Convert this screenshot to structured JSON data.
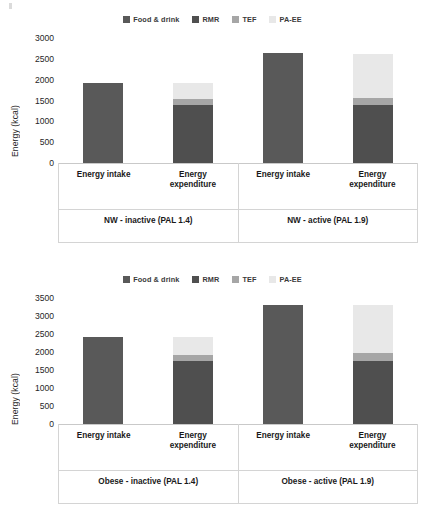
{
  "legend": {
    "items": [
      {
        "label": "Food & drink",
        "color": "#595959",
        "name": "legend-food-drink"
      },
      {
        "label": "RMR",
        "color": "#4f4f4f",
        "name": "legend-rmr"
      },
      {
        "label": "TEF",
        "color": "#a6a6a6",
        "name": "legend-tef"
      },
      {
        "label": "PA-EE",
        "color": "#e8e8e8",
        "name": "legend-pa-ee"
      }
    ]
  },
  "charts": [
    {
      "id": "nw",
      "ylabel": "Energy (kcal)",
      "yticks": [
        "3000",
        "2500",
        "2000",
        "1500",
        "1000",
        "500",
        "0"
      ],
      "groups": [
        {
          "label": "NW - inactive (PAL 1.4)",
          "bars": [
            {
              "label": "Energy intake",
              "segments": [
                {
                  "series": "Food & drink",
                  "value": 1920
                }
              ]
            },
            {
              "label": "Energy\nexpenditure",
              "segments": [
                {
                  "series": "RMR",
                  "value": 1390
                },
                {
                  "series": "TEF",
                  "value": 140
                },
                {
                  "series": "PA-EE",
                  "value": 390
                }
              ]
            }
          ]
        },
        {
          "label": "NW - active (PAL 1.9)",
          "bars": [
            {
              "label": "Energy intake",
              "segments": [
                {
                  "series": "Food & drink",
                  "value": 2630
                }
              ]
            },
            {
              "label": "Energy\nexpenditure",
              "segments": [
                {
                  "series": "RMR",
                  "value": 1390
                },
                {
                  "series": "TEF",
                  "value": 160
                },
                {
                  "series": "PA-EE",
                  "value": 1070
                }
              ]
            }
          ]
        }
      ]
    },
    {
      "id": "obese",
      "ylabel": "Energy (kcal)",
      "yticks": [
        "3500",
        "3000",
        "2500",
        "2000",
        "1500",
        "1000",
        "500",
        "0"
      ],
      "groups": [
        {
          "label": "Obese - inactive (PAL 1.4)",
          "bars": [
            {
              "label": "Energy intake",
              "segments": [
                {
                  "series": "Food & drink",
                  "value": 2420
                }
              ]
            },
            {
              "label": "Energy\nexpenditure",
              "segments": [
                {
                  "series": "RMR",
                  "value": 1750
                },
                {
                  "series": "TEF",
                  "value": 170
                },
                {
                  "series": "PA-EE",
                  "value": 500
                }
              ]
            }
          ]
        },
        {
          "label": "Obese - active (PAL 1.9)",
          "bars": [
            {
              "label": "Energy intake",
              "segments": [
                {
                  "series": "Food & drink",
                  "value": 3300
                }
              ]
            },
            {
              "label": "Energy\nexpenditure",
              "segments": [
                {
                  "series": "RMR",
                  "value": 1760
                },
                {
                  "series": "TEF",
                  "value": 200
                },
                {
                  "series": "PA-EE",
                  "value": 1340
                }
              ]
            }
          ]
        }
      ]
    }
  ],
  "chart_data": [
    {
      "type": "bar",
      "stacked": true,
      "title": "",
      "xlabel": "",
      "ylabel": "Energy (kcal)",
      "ylim": [
        0,
        3000
      ],
      "ytick_step": 500,
      "grid": false,
      "legend_position": "top-center",
      "group_labels": [
        "NW - inactive (PAL 1.4)",
        "NW - active (PAL 1.9)"
      ],
      "categories": [
        "NW - inactive (PAL 1.4) / Energy intake",
        "NW - inactive (PAL 1.4) / Energy expenditure",
        "NW - active (PAL 1.9) / Energy intake",
        "NW - active (PAL 1.9) / Energy expenditure"
      ],
      "series": [
        {
          "name": "Food & drink",
          "color": "#595959",
          "values": [
            1920,
            0,
            2630,
            0
          ]
        },
        {
          "name": "RMR",
          "color": "#4f4f4f",
          "values": [
            0,
            1390,
            0,
            1390
          ]
        },
        {
          "name": "TEF",
          "color": "#a6a6a6",
          "values": [
            0,
            140,
            0,
            160
          ]
        },
        {
          "name": "PA-EE",
          "color": "#e8e8e8",
          "values": [
            0,
            390,
            0,
            1070
          ]
        }
      ],
      "totals": [
        1920,
        1920,
        2630,
        2620
      ]
    },
    {
      "type": "bar",
      "stacked": true,
      "title": "",
      "xlabel": "",
      "ylabel": "Energy (kcal)",
      "ylim": [
        0,
        3500
      ],
      "ytick_step": 500,
      "grid": false,
      "legend_position": "top-center",
      "group_labels": [
        "Obese - inactive (PAL 1.4)",
        "Obese - active (PAL 1.9)"
      ],
      "categories": [
        "Obese - inactive (PAL 1.4) / Energy intake",
        "Obese - inactive (PAL 1.4) / Energy expenditure",
        "Obese - active (PAL 1.9) / Energy intake",
        "Obese - active (PAL 1.9) / Energy expenditure"
      ],
      "series": [
        {
          "name": "Food & drink",
          "color": "#595959",
          "values": [
            2420,
            0,
            3300,
            0
          ]
        },
        {
          "name": "RMR",
          "color": "#4f4f4f",
          "values": [
            0,
            1750,
            0,
            1760
          ]
        },
        {
          "name": "TEF",
          "color": "#a6a6a6",
          "values": [
            0,
            170,
            0,
            200
          ]
        },
        {
          "name": "PA-EE",
          "color": "#e8e8e8",
          "values": [
            0,
            500,
            0,
            1340
          ]
        }
      ],
      "totals": [
        2420,
        2420,
        3300,
        3300
      ]
    }
  ]
}
